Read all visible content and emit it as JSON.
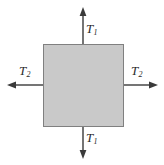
{
  "figure": {
    "name": "biaxial-tension-stress-element",
    "background_color": "#ffffff"
  },
  "element": {
    "shape": "square",
    "fill_color": "#c9c9c9",
    "stroke_color": "#808080",
    "stroke_width": 1,
    "x": 43,
    "y": 44,
    "width": 81,
    "height": 83
  },
  "arrow_style": {
    "color": "#3a3a3a",
    "shaft_width": 1.4,
    "head_length": 9,
    "head_width": 7
  },
  "arrows": [
    {
      "id": "arrow-top",
      "direction": "up",
      "from": {
        "x": 83,
        "y": 44
      },
      "to": {
        "x": 83,
        "y": 8
      },
      "label": "T",
      "subscript": "1"
    },
    {
      "id": "arrow-bottom",
      "direction": "down",
      "from": {
        "x": 83,
        "y": 127
      },
      "to": {
        "x": 83,
        "y": 158
      },
      "label": "T",
      "subscript": "1"
    },
    {
      "id": "arrow-left",
      "direction": "left",
      "from": {
        "x": 43,
        "y": 85
      },
      "to": {
        "x": 8,
        "y": 85
      },
      "label": "T",
      "subscript": "2"
    },
    {
      "id": "arrow-right",
      "direction": "right",
      "from": {
        "x": 124,
        "y": 85
      },
      "to": {
        "x": 157,
        "y": 85
      },
      "label": "T",
      "subscript": "2"
    }
  ],
  "labels": {
    "top": {
      "symbol": "T",
      "subscript": "1"
    },
    "bottom": {
      "symbol": "T",
      "subscript": "1"
    },
    "left": {
      "symbol": "T",
      "subscript": "2"
    },
    "right": {
      "symbol": "T",
      "subscript": "2"
    }
  }
}
